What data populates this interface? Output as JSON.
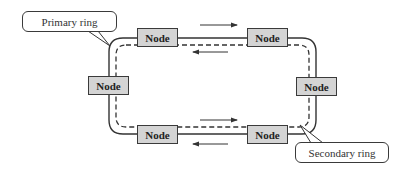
{
  "diagram": {
    "nodes": [
      {
        "id": "top-left",
        "label": "Node"
      },
      {
        "id": "top-right",
        "label": "Node"
      },
      {
        "id": "left",
        "label": "Node"
      },
      {
        "id": "right",
        "label": "Node"
      },
      {
        "id": "bottom-left",
        "label": "Node"
      },
      {
        "id": "bottom-right",
        "label": "Node"
      }
    ],
    "callouts": {
      "primary": "Primary ring",
      "secondary": "Secondary ring"
    },
    "rings": {
      "primary": {
        "style": "solid",
        "direction": "clockwise"
      },
      "secondary": {
        "style": "dashed",
        "direction": "counterclockwise"
      }
    },
    "colors": {
      "node_fill": "#d4d4d4",
      "stroke": "#3a3a3a",
      "background": "#ffffff"
    }
  }
}
